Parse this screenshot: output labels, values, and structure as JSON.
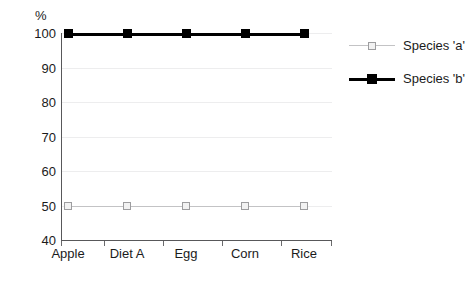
{
  "chart_data": {
    "type": "line",
    "title": "",
    "xlabel": "",
    "ylabel": "%",
    "unit_label": "%",
    "categories": [
      "Apple",
      "Diet A",
      "Egg",
      "Corn",
      "Rice"
    ],
    "series": [
      {
        "name": "Species 'a'",
        "values": [
          50,
          50,
          50,
          50,
          50
        ],
        "color": "#c3c3c5",
        "marker": "open-square"
      },
      {
        "name": "Species 'b'",
        "values": [
          100,
          100,
          100,
          100,
          100
        ],
        "color": "#000000",
        "marker": "filled-square"
      }
    ],
    "ylim": [
      40,
      100
    ],
    "yticks": [
      40,
      50,
      60,
      70,
      80,
      90,
      100
    ],
    "ytick_labels": [
      "40",
      "50",
      "60",
      "70",
      "80",
      "90",
      "100"
    ],
    "grid": true,
    "legend_position": "right"
  },
  "legend": {
    "entries": [
      {
        "label": "Species 'a'"
      },
      {
        "label": "Species 'b'"
      }
    ]
  }
}
